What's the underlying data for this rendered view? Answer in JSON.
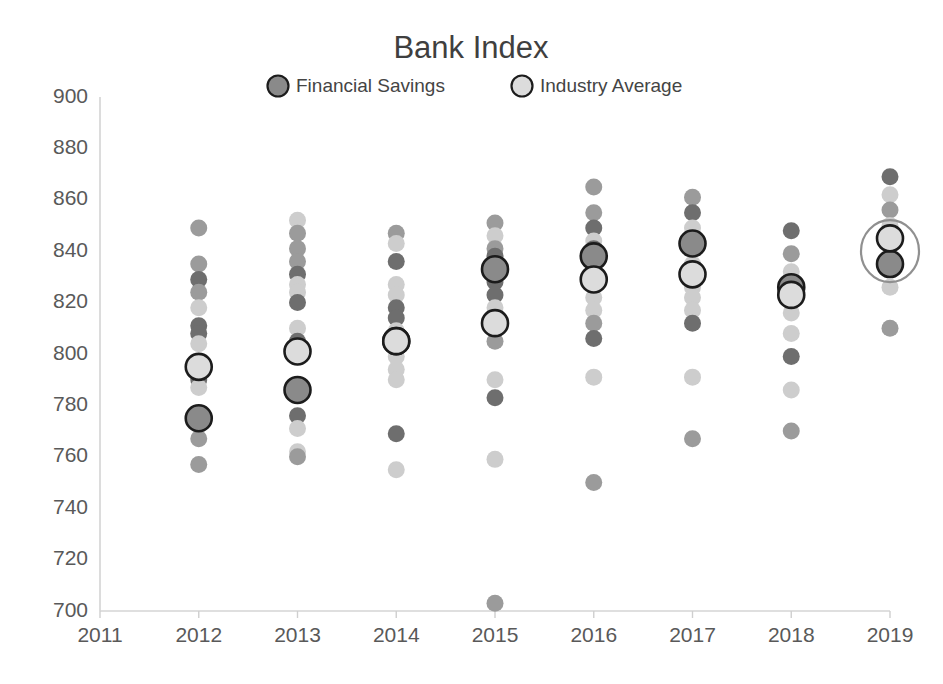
{
  "chart_data": {
    "type": "scatter",
    "title": "Bank Index",
    "xlabel": "",
    "ylabel": "",
    "xlim": [
      2011,
      2019
    ],
    "ylim": [
      700,
      900
    ],
    "grid": false,
    "legend_position": "top-center",
    "x_ticks": [
      "2011",
      "2012",
      "2013",
      "2014",
      "2015",
      "2016",
      "2017",
      "2018",
      "2019"
    ],
    "y_ticks": [
      "900",
      "880",
      "860",
      "840",
      "820",
      "800",
      "780",
      "760",
      "740",
      "720",
      "700"
    ],
    "legend": [
      {
        "name": "Financial Savings",
        "color": "#8a8a8a",
        "marker": "circle-dark-outlined"
      },
      {
        "name": "Industry Average",
        "color": "#dcdcdc",
        "marker": "circle-light-outlined"
      }
    ],
    "annotations": [
      {
        "type": "highlight-ellipse",
        "year": 2019,
        "center_value": 840,
        "note": "circle around 2019 markers"
      }
    ],
    "series": [
      {
        "name": "Financial Savings",
        "marker": "large-outlined",
        "categories": [
          2012,
          2013,
          2014,
          2015,
          2016,
          2017,
          2018,
          2019
        ],
        "values": [
          775,
          786,
          805,
          833,
          838,
          843,
          826,
          835
        ]
      },
      {
        "name": "Industry Average",
        "marker": "large-outlined",
        "categories": [
          2012,
          2013,
          2014,
          2015,
          2016,
          2017,
          2018,
          2019
        ],
        "values": [
          795,
          801,
          805,
          812,
          829,
          831,
          823,
          845
        ]
      }
    ],
    "scatter_cloud": [
      {
        "year": 2012,
        "points": [
          {
            "v": 849,
            "shade": "mid"
          },
          {
            "v": 835,
            "shade": "mid"
          },
          {
            "v": 829,
            "shade": "dark"
          },
          {
            "v": 824,
            "shade": "mid"
          },
          {
            "v": 818,
            "shade": "light"
          },
          {
            "v": 811,
            "shade": "dark"
          },
          {
            "v": 808,
            "shade": "dark"
          },
          {
            "v": 804,
            "shade": "light"
          },
          {
            "v": 790,
            "shade": "dark"
          },
          {
            "v": 787,
            "shade": "light"
          },
          {
            "v": 767,
            "shade": "mid"
          },
          {
            "v": 757,
            "shade": "mid"
          }
        ]
      },
      {
        "year": 2013,
        "points": [
          {
            "v": 852,
            "shade": "light"
          },
          {
            "v": 847,
            "shade": "mid"
          },
          {
            "v": 841,
            "shade": "mid"
          },
          {
            "v": 836,
            "shade": "mid"
          },
          {
            "v": 831,
            "shade": "dark"
          },
          {
            "v": 827,
            "shade": "light"
          },
          {
            "v": 824,
            "shade": "light"
          },
          {
            "v": 820,
            "shade": "dark"
          },
          {
            "v": 810,
            "shade": "light"
          },
          {
            "v": 805,
            "shade": "dark"
          },
          {
            "v": 776,
            "shade": "dark"
          },
          {
            "v": 771,
            "shade": "light"
          },
          {
            "v": 762,
            "shade": "light"
          },
          {
            "v": 760,
            "shade": "mid"
          }
        ]
      },
      {
        "year": 2014,
        "points": [
          {
            "v": 847,
            "shade": "mid"
          },
          {
            "v": 843,
            "shade": "light"
          },
          {
            "v": 836,
            "shade": "dark"
          },
          {
            "v": 827,
            "shade": "light"
          },
          {
            "v": 823,
            "shade": "light"
          },
          {
            "v": 818,
            "shade": "dark"
          },
          {
            "v": 814,
            "shade": "dark"
          },
          {
            "v": 809,
            "shade": "light"
          },
          {
            "v": 799,
            "shade": "light"
          },
          {
            "v": 794,
            "shade": "light"
          },
          {
            "v": 790,
            "shade": "light"
          },
          {
            "v": 769,
            "shade": "dark"
          },
          {
            "v": 755,
            "shade": "light"
          }
        ]
      },
      {
        "year": 2015,
        "points": [
          {
            "v": 851,
            "shade": "mid"
          },
          {
            "v": 846,
            "shade": "light"
          },
          {
            "v": 841,
            "shade": "mid"
          },
          {
            "v": 838,
            "shade": "dark"
          },
          {
            "v": 828,
            "shade": "dark"
          },
          {
            "v": 823,
            "shade": "dark"
          },
          {
            "v": 818,
            "shade": "light"
          },
          {
            "v": 805,
            "shade": "mid"
          },
          {
            "v": 790,
            "shade": "light"
          },
          {
            "v": 783,
            "shade": "dark"
          },
          {
            "v": 759,
            "shade": "light"
          },
          {
            "v": 703,
            "shade": "mid"
          }
        ]
      },
      {
        "year": 2016,
        "points": [
          {
            "v": 865,
            "shade": "mid"
          },
          {
            "v": 855,
            "shade": "mid"
          },
          {
            "v": 849,
            "shade": "dark"
          },
          {
            "v": 844,
            "shade": "light"
          },
          {
            "v": 841,
            "shade": "dark"
          },
          {
            "v": 822,
            "shade": "light"
          },
          {
            "v": 817,
            "shade": "light"
          },
          {
            "v": 812,
            "shade": "mid"
          },
          {
            "v": 806,
            "shade": "dark"
          },
          {
            "v": 791,
            "shade": "light"
          },
          {
            "v": 750,
            "shade": "mid"
          }
        ]
      },
      {
        "year": 2017,
        "points": [
          {
            "v": 861,
            "shade": "mid"
          },
          {
            "v": 855,
            "shade": "dark"
          },
          {
            "v": 849,
            "shade": "light"
          },
          {
            "v": 845,
            "shade": "light"
          },
          {
            "v": 835,
            "shade": "light"
          },
          {
            "v": 826,
            "shade": "light"
          },
          {
            "v": 822,
            "shade": "light"
          },
          {
            "v": 817,
            "shade": "light"
          },
          {
            "v": 812,
            "shade": "dark"
          },
          {
            "v": 791,
            "shade": "light"
          },
          {
            "v": 767,
            "shade": "mid"
          }
        ]
      },
      {
        "year": 2018,
        "points": [
          {
            "v": 848,
            "shade": "dark"
          },
          {
            "v": 839,
            "shade": "mid"
          },
          {
            "v": 832,
            "shade": "light"
          },
          {
            "v": 820,
            "shade": "light"
          },
          {
            "v": 816,
            "shade": "light"
          },
          {
            "v": 808,
            "shade": "light"
          },
          {
            "v": 799,
            "shade": "dark"
          },
          {
            "v": 786,
            "shade": "light"
          },
          {
            "v": 770,
            "shade": "mid"
          }
        ]
      },
      {
        "year": 2019,
        "points": [
          {
            "v": 869,
            "shade": "dark"
          },
          {
            "v": 862,
            "shade": "light"
          },
          {
            "v": 856,
            "shade": "mid"
          },
          {
            "v": 850,
            "shade": "light"
          },
          {
            "v": 845,
            "shade": "mid"
          },
          {
            "v": 826,
            "shade": "light"
          },
          {
            "v": 810,
            "shade": "mid"
          }
        ]
      }
    ]
  }
}
